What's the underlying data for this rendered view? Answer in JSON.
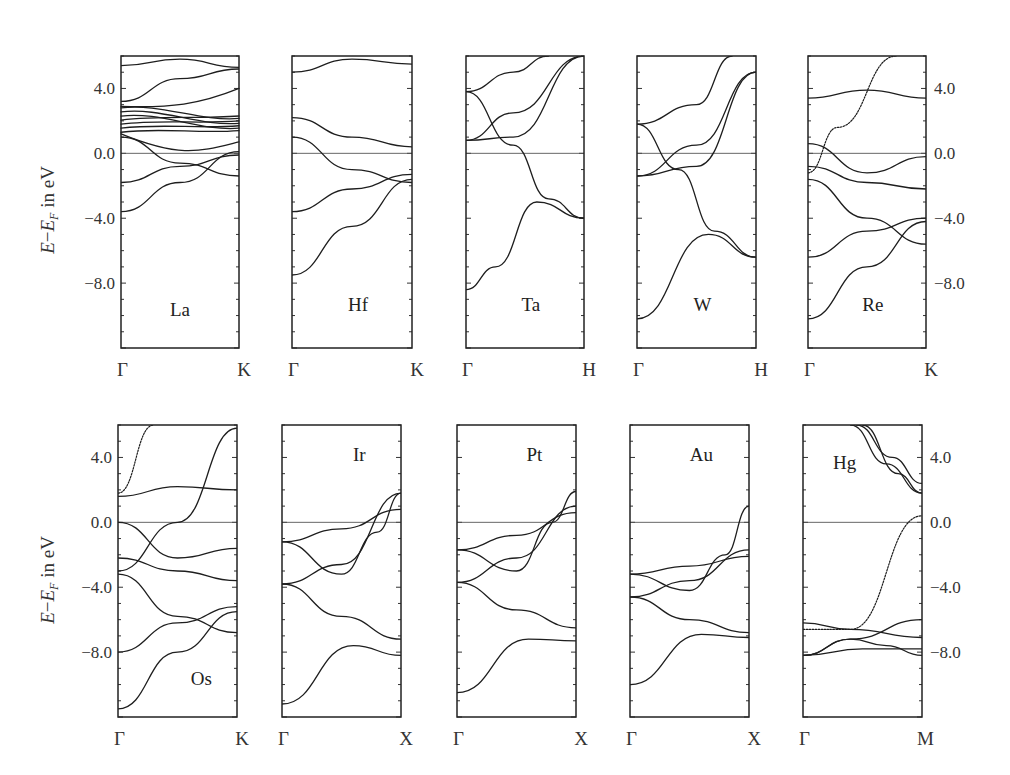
{
  "figure": {
    "y_axis_label": "E−E_F in eV",
    "y_axis_label_parts": {
      "E": "E",
      "minus": "−",
      "EF": "E",
      "F_sub": "F",
      "unit": " in eV"
    },
    "y_ticks": [
      "4.0",
      "0.0",
      "−4.0",
      "−8.0"
    ]
  },
  "chart_data": [
    {
      "type": "line",
      "title": "La",
      "xlabel_ticks": [
        "Γ",
        "K"
      ],
      "ylabel": "E−E_F in eV",
      "ylim": [
        -12,
        6
      ],
      "y_ticks": [
        4.0,
        0.0,
        -4.0,
        -8.0
      ],
      "fermi_level": 0.0,
      "note": "dense d-band manifold between ~1 and ~3 eV",
      "series": [
        {
          "name": "band1",
          "x": [
            0,
            0.5,
            1
          ],
          "values": [
            -3.6,
            -1.8,
            0.1
          ]
        },
        {
          "name": "band2",
          "x": [
            0,
            0.5,
            1
          ],
          "values": [
            -1.8,
            -0.8,
            -0.1
          ]
        },
        {
          "name": "band3",
          "x": [
            0,
            0.5,
            1
          ],
          "values": [
            1.0,
            -0.6,
            -1.4
          ]
        },
        {
          "name": "band4",
          "x": [
            0,
            0.5,
            1
          ],
          "values": [
            3.2,
            4.6,
            5.2
          ]
        },
        {
          "name": "band5",
          "x": [
            0,
            0.5,
            1
          ],
          "values": [
            5.4,
            5.8,
            5.3
          ]
        }
      ]
    },
    {
      "type": "line",
      "title": "Hf",
      "xlabel_ticks": [
        "Γ",
        "K"
      ],
      "ylabel": "E−E_F in eV",
      "ylim": [
        -12,
        6
      ],
      "fermi_level": 0.0,
      "series": [
        {
          "name": "band1",
          "x": [
            0,
            0.5,
            1
          ],
          "values": [
            -7.5,
            -4.5,
            -1.6
          ]
        },
        {
          "name": "band2",
          "x": [
            0,
            0.5,
            1
          ],
          "values": [
            -3.6,
            -2.2,
            -1.3
          ]
        },
        {
          "name": "band3",
          "x": [
            0,
            0.5,
            1
          ],
          "values": [
            1.0,
            -1.0,
            -1.8
          ]
        },
        {
          "name": "band4",
          "x": [
            0,
            0.5,
            1
          ],
          "values": [
            2.2,
            1.0,
            0.4
          ]
        },
        {
          "name": "band5",
          "x": [
            0,
            0.5,
            1
          ],
          "values": [
            5.0,
            5.8,
            5.5
          ]
        }
      ]
    },
    {
      "type": "line",
      "title": "Ta",
      "xlabel_ticks": [
        "Γ",
        "H"
      ],
      "ylabel": "",
      "ylim": [
        -12,
        6
      ],
      "fermi_level": 0.0,
      "series": [
        {
          "name": "band1",
          "x": [
            0,
            0.25,
            0.6,
            1
          ],
          "values": [
            -8.4,
            -7.0,
            -3.0,
            -4.0
          ]
        },
        {
          "name": "band2",
          "x": [
            0,
            0.4,
            0.7,
            1
          ],
          "values": [
            3.8,
            0.5,
            -2.8,
            -4.0
          ]
        },
        {
          "name": "band3",
          "x": [
            0,
            0.4,
            1
          ],
          "values": [
            0.8,
            1.0,
            6.0
          ]
        },
        {
          "name": "band4",
          "x": [
            0,
            0.4,
            1
          ],
          "values": [
            0.8,
            2.5,
            6.0
          ]
        },
        {
          "name": "band5",
          "x": [
            0,
            0.4,
            0.7
          ],
          "values": [
            3.8,
            5.0,
            6.0
          ]
        }
      ]
    },
    {
      "type": "line",
      "title": "W",
      "xlabel_ticks": [
        "Γ",
        "H"
      ],
      "ylabel": "",
      "ylim": [
        -12,
        6
      ],
      "fermi_level": 0.0,
      "series": [
        {
          "name": "band1",
          "x": [
            0,
            0.6,
            1
          ],
          "values": [
            -10.2,
            -5.0,
            -6.4
          ]
        },
        {
          "name": "band2",
          "x": [
            0,
            0.35,
            0.65,
            1
          ],
          "values": [
            1.8,
            -1.0,
            -4.8,
            -6.4
          ]
        },
        {
          "name": "band3",
          "x": [
            0,
            0.5,
            1
          ],
          "values": [
            -1.4,
            0.5,
            5.0
          ]
        },
        {
          "name": "band4",
          "x": [
            0,
            0.5,
            1
          ],
          "values": [
            -1.4,
            -0.8,
            5.0
          ]
        },
        {
          "name": "band5",
          "x": [
            0,
            0.5,
            0.8
          ],
          "values": [
            1.8,
            3.0,
            6.0
          ]
        }
      ]
    },
    {
      "type": "line",
      "title": "Re",
      "xlabel_ticks": [
        "Γ",
        "K"
      ],
      "ylabel": "E−E_F in eV",
      "ylim": [
        -12,
        6
      ],
      "fermi_level": 0.0,
      "series": [
        {
          "name": "band1",
          "x": [
            0,
            0.5,
            1
          ],
          "values": [
            -10.2,
            -7.0,
            -4.2
          ]
        },
        {
          "name": "band2",
          "x": [
            0,
            0.5,
            1
          ],
          "values": [
            -6.4,
            -4.8,
            -4.0
          ]
        },
        {
          "name": "band3",
          "x": [
            0,
            0.5,
            1
          ],
          "values": [
            -1.6,
            -4.0,
            -5.6
          ]
        },
        {
          "name": "band4",
          "x": [
            0,
            0.5,
            1
          ],
          "values": [
            -0.8,
            -1.8,
            -2.2
          ]
        },
        {
          "name": "band5",
          "x": [
            0,
            0.5,
            1
          ],
          "values": [
            0.6,
            -1.2,
            -0.2
          ]
        },
        {
          "name": "band6",
          "x": [
            0,
            0.5,
            1
          ],
          "values": [
            3.4,
            3.9,
            3.4
          ]
        },
        {
          "name": "band7-free",
          "x": [
            0,
            0.25,
            0.75
          ],
          "values": [
            -1.2,
            1.6,
            6.0
          ]
        }
      ]
    },
    {
      "type": "line",
      "title": "Os",
      "xlabel_ticks": [
        "Γ",
        "K"
      ],
      "ylabel": "E−E_F in eV",
      "ylim": [
        -12,
        6
      ],
      "fermi_level": 0.0,
      "series": [
        {
          "name": "band1",
          "x": [
            0,
            0.5,
            1
          ],
          "values": [
            -11.5,
            -8.0,
            -5.5
          ]
        },
        {
          "name": "band2",
          "x": [
            0,
            0.5,
            1
          ],
          "values": [
            -8.0,
            -6.2,
            -5.2
          ]
        },
        {
          "name": "band3",
          "x": [
            0,
            0.5,
            1
          ],
          "values": [
            -3.2,
            -5.8,
            -6.8
          ]
        },
        {
          "name": "band4",
          "x": [
            0,
            0.5,
            1
          ],
          "values": [
            -2.2,
            -3.0,
            -3.6
          ]
        },
        {
          "name": "band5",
          "x": [
            0,
            0.5,
            1
          ],
          "values": [
            0.0,
            -2.2,
            -1.6
          ]
        },
        {
          "name": "band6",
          "x": [
            0,
            0.5,
            1
          ],
          "values": [
            1.6,
            2.2,
            2.0
          ]
        },
        {
          "name": "band7",
          "x": [
            0,
            0.5,
            1
          ],
          "values": [
            -3.0,
            0.0,
            5.8
          ]
        },
        {
          "name": "band8-free",
          "x": [
            0,
            0.3
          ],
          "values": [
            1.8,
            6.0
          ]
        }
      ]
    },
    {
      "type": "line",
      "title": "Ir",
      "xlabel_ticks": [
        "Γ",
        "X"
      ],
      "ylabel": "",
      "ylim": [
        -12,
        6
      ],
      "fermi_level": 0.0,
      "series": [
        {
          "name": "band1",
          "x": [
            0,
            0.6,
            1
          ],
          "values": [
            -11.2,
            -7.6,
            -8.2
          ]
        },
        {
          "name": "band2",
          "x": [
            0,
            0.5,
            1
          ],
          "values": [
            -3.8,
            -5.8,
            -7.2
          ]
        },
        {
          "name": "band3",
          "x": [
            0,
            0.5,
            1
          ],
          "values": [
            -3.8,
            -2.6,
            1.8
          ]
        },
        {
          "name": "band4",
          "x": [
            0,
            0.5,
            0.8,
            1
          ],
          "values": [
            -1.2,
            -3.2,
            -0.6,
            1.8
          ]
        },
        {
          "name": "band5",
          "x": [
            0,
            0.5,
            1
          ],
          "values": [
            -1.2,
            -0.4,
            0.8
          ]
        }
      ]
    },
    {
      "type": "line",
      "title": "Pt",
      "xlabel_ticks": [
        "Γ",
        "X"
      ],
      "ylabel": "",
      "ylim": [
        -12,
        6
      ],
      "fermi_level": 0.0,
      "series": [
        {
          "name": "band1",
          "x": [
            0,
            0.6,
            1
          ],
          "values": [
            -10.5,
            -7.2,
            -7.3
          ]
        },
        {
          "name": "band2",
          "x": [
            0,
            0.5,
            1
          ],
          "values": [
            -3.7,
            -5.4,
            -6.5
          ]
        },
        {
          "name": "band3",
          "x": [
            0,
            0.5,
            1
          ],
          "values": [
            -3.7,
            -2.2,
            1.0
          ]
        },
        {
          "name": "band4",
          "x": [
            0,
            0.5,
            0.8,
            1
          ],
          "values": [
            -1.7,
            -3.0,
            0.0,
            1.9
          ]
        },
        {
          "name": "band5",
          "x": [
            0,
            0.5,
            1
          ],
          "values": [
            -1.7,
            -0.8,
            0.6
          ]
        }
      ]
    },
    {
      "type": "line",
      "title": "Au",
      "xlabel_ticks": [
        "Γ",
        "X"
      ],
      "ylabel": "",
      "ylim": [
        -12,
        6
      ],
      "fermi_level": 0.0,
      "series": [
        {
          "name": "band1",
          "x": [
            0,
            0.6,
            1
          ],
          "values": [
            -10.0,
            -6.9,
            -7.1
          ]
        },
        {
          "name": "band2",
          "x": [
            0,
            0.5,
            1
          ],
          "values": [
            -4.6,
            -6.0,
            -6.8
          ]
        },
        {
          "name": "band3",
          "x": [
            0,
            0.5,
            1
          ],
          "values": [
            -4.6,
            -3.6,
            -1.7
          ]
        },
        {
          "name": "band4",
          "x": [
            0,
            0.5,
            0.8,
            1
          ],
          "values": [
            -3.2,
            -4.2,
            -2.0,
            1.0
          ]
        },
        {
          "name": "band5",
          "x": [
            0,
            0.5,
            1
          ],
          "values": [
            -3.2,
            -2.7,
            -2.1
          ]
        }
      ]
    },
    {
      "type": "line",
      "title": "Hg",
      "xlabel_ticks": [
        "Γ",
        "M"
      ],
      "ylabel": "E−E_F in eV",
      "ylim": [
        -12,
        6
      ],
      "fermi_level": 0.0,
      "series": [
        {
          "name": "band1",
          "x": [
            0,
            0.4,
            1
          ],
          "values": [
            -6.2,
            -6.6,
            -7.1
          ]
        },
        {
          "name": "band2",
          "x": [
            0,
            0.4,
            1
          ],
          "values": [
            -8.2,
            -7.2,
            -6.0
          ]
        },
        {
          "name": "band3",
          "x": [
            0,
            0.5,
            1
          ],
          "values": [
            -8.2,
            -7.8,
            -7.8
          ]
        },
        {
          "name": "band4",
          "x": [
            0,
            0.4,
            0.7,
            1
          ],
          "values": [
            -8.2,
            -7.2,
            -7.6,
            -8.2
          ]
        },
        {
          "name": "band5-sp",
          "x": [
            0,
            0.4,
            1
          ],
          "values": [
            -6.6,
            -6.6,
            0.4
          ]
        },
        {
          "name": "band6",
          "x": [
            0.4,
            0.7,
            1
          ],
          "values": [
            6.0,
            3.6,
            1.8
          ]
        },
        {
          "name": "band7",
          "x": [
            0.45,
            0.75,
            1
          ],
          "values": [
            6.0,
            4.0,
            2.4
          ]
        },
        {
          "name": "band8",
          "x": [
            0.5,
            0.8,
            1
          ],
          "values": [
            6.0,
            3.0,
            1.8
          ]
        }
      ]
    }
  ]
}
